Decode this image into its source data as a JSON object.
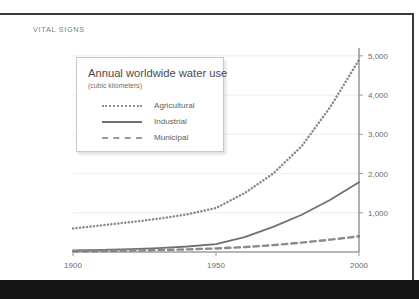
{
  "page": {
    "kicker": "VITAL SIGNS",
    "frame_color": "#3a3a3a",
    "bottom_bar_color": "#151515",
    "background": "#ffffff"
  },
  "legend_card": {
    "title": "Annual worldwide water use",
    "subtitle": "(cubic kilometers)",
    "entries": [
      {
        "label": "Agricultural",
        "style": "dotted",
        "color": "#8f8f8f",
        "swatch_icon": "dotted-line-icon"
      },
      {
        "label": "Industrial",
        "style": "solid",
        "color": "#707070",
        "swatch_icon": "solid-line-icon"
      },
      {
        "label": "Municipal",
        "style": "dashed",
        "color": "#9a9a9a",
        "swatch_icon": "dashed-line-icon"
      }
    ]
  },
  "chart_data": {
    "type": "line",
    "title": "Annual worldwide water use",
    "subtitle": "(cubic kilometers)",
    "xlabel": "",
    "ylabel": "cubic kilometers",
    "xlim": [
      1900,
      2000
    ],
    "ylim": [
      0,
      5200
    ],
    "grid": true,
    "y_axis_position": "right",
    "legend_position": "inside-top-left",
    "xticks": [
      1900,
      1950,
      2000
    ],
    "xtick_labels": [
      "1900",
      "1950",
      "2000"
    ],
    "yticks": [
      1000,
      2000,
      3000,
      4000,
      5000
    ],
    "ytick_labels": [
      "1,000",
      "2,000",
      "3,000",
      "4,000",
      "5,000"
    ],
    "x": [
      1900,
      1910,
      1920,
      1930,
      1940,
      1950,
      1960,
      1970,
      1980,
      1990,
      2000
    ],
    "series": [
      {
        "name": "Agricultural",
        "style": "dotted",
        "color": "#8f8f8f",
        "values": [
          600,
          680,
          760,
          850,
          960,
          1120,
          1500,
          2000,
          2700,
          3700,
          4900
        ]
      },
      {
        "name": "Industrial",
        "style": "solid",
        "color": "#707070",
        "values": [
          40,
          55,
          75,
          100,
          140,
          200,
          380,
          640,
          950,
          1330,
          1780
        ]
      },
      {
        "name": "Municipal",
        "style": "dashed",
        "color": "#9a9a9a",
        "values": [
          20,
          28,
          38,
          50,
          68,
          90,
          125,
          175,
          240,
          315,
          400
        ]
      }
    ]
  }
}
